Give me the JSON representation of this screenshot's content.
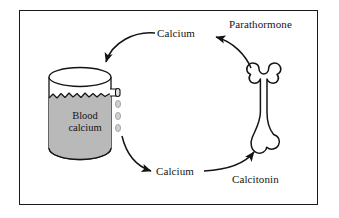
{
  "figure": {
    "type": "biology-diagram",
    "frame_color": "#1a1a1a",
    "background_color": "#ffffff"
  },
  "labels": {
    "calcium_top": "Calcium",
    "calcium_bottom": "Calcium",
    "parathormone": "Parathormone",
    "calcitonin": "Calcitonin",
    "vessel_line1": "Blood",
    "vessel_line2": "calcium"
  },
  "shapes": {
    "vessel": {
      "name": "blood-calcium-container",
      "fill_color": "#b9b9b9",
      "outline_color": "#1a1a1a",
      "spout": "right-side-tap",
      "droplets": 3,
      "droplet_color": "#cfcfcf"
    },
    "bone": {
      "name": "bone",
      "fill_color": "#ffffff",
      "outline_color": "#141414",
      "orientation": "vertical"
    }
  },
  "arrows": [
    {
      "name": "parathormone-to-calcium",
      "from": "Parathormone / bone",
      "to": "Calcium (top)",
      "direction": "right-to-left"
    },
    {
      "name": "calcium-to-vessel",
      "from": "Calcium (top)",
      "to": "Blood calcium container",
      "direction": "down-left"
    },
    {
      "name": "vessel-to-calcium",
      "from": "Blood calcium container droplets",
      "to": "Calcium (bottom)",
      "direction": "down-right"
    },
    {
      "name": "calcitonin-to-bone",
      "from": "Calcium (bottom) / Calcitonin",
      "to": "Bone",
      "direction": "up-right"
    }
  ]
}
